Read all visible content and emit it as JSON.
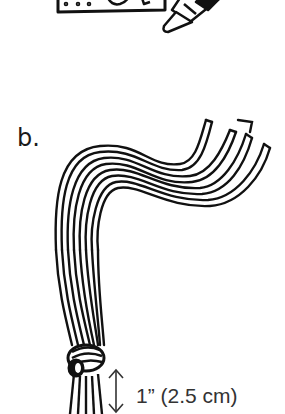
{
  "figure": {
    "top_panel": {
      "description": "Partial view of a card/paper with a crayon drawing on it",
      "objects": [
        "card",
        "crayon"
      ]
    },
    "step_label": "b.",
    "main_illustration": {
      "description": "Bundle of cords curving into fringed ends, tied with a knot near the bottom",
      "strand_count": 4,
      "knot": true
    },
    "measurement": {
      "label": "1” (2.5 cm)",
      "arrow": "double-headed vertical arrow"
    },
    "colors": {
      "ink": "#111111",
      "background": "#ffffff",
      "text": "#333333"
    }
  }
}
